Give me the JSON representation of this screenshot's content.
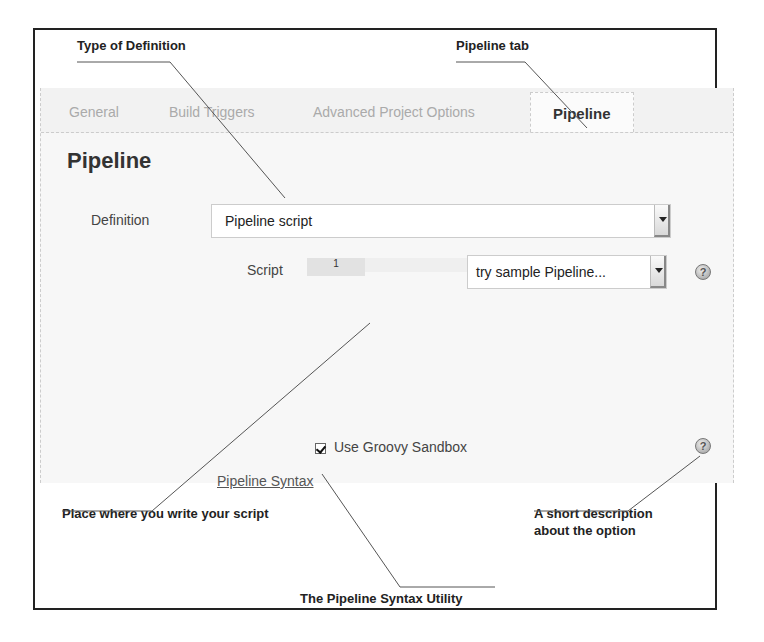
{
  "annotations": {
    "type_of_definition": "Type of Definition",
    "pipeline_tab": "Pipeline tab",
    "script_place": "Place where you write your script",
    "short_description_line1": "A short description",
    "short_description_line2": "about the option",
    "syntax_utility": "The Pipeline Syntax Utility"
  },
  "tabs": [
    {
      "label": "General",
      "active": false
    },
    {
      "label": "Build Triggers",
      "active": false
    },
    {
      "label": "Advanced Project Options",
      "active": false
    },
    {
      "label": "Pipeline",
      "active": true
    }
  ],
  "section": {
    "title": "Pipeline",
    "definition_label": "Definition",
    "definition_value": "Pipeline script",
    "script_label": "Script",
    "line_number": "1",
    "sample_select_value": "try sample Pipeline...",
    "sandbox_label": "Use Groovy Sandbox",
    "sandbox_checked": true,
    "syntax_link": "Pipeline Syntax"
  },
  "icons": {
    "help": "help-icon",
    "dropdown": "chevron-down-icon",
    "checkbox": "checkbox-checked-icon"
  }
}
